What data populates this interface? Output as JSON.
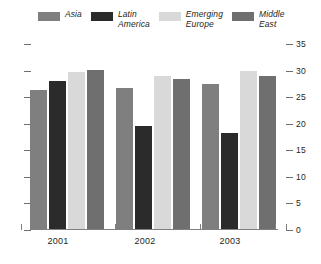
{
  "chart_data": {
    "type": "bar",
    "title": "",
    "subtitle": "",
    "xlabel": "",
    "ylabel": "",
    "categories": [
      "2001",
      "2002",
      "2003"
    ],
    "series": [
      {
        "name": "Asia",
        "color": "#7f7f7f",
        "values": [
          26.3,
          26.8,
          27.4
        ]
      },
      {
        "name": "Latin\nAmerica",
        "color": "#2b2b2b",
        "values": [
          28.0,
          19.5,
          18.3
        ]
      },
      {
        "name": "Emerging\nEurope",
        "color": "#d9d9d9",
        "values": [
          29.7,
          28.9,
          29.9
        ]
      },
      {
        "name": "Middle\nEast",
        "color": "#6f6f6f",
        "values": [
          30.2,
          28.5,
          28.9
        ]
      }
    ],
    "ylim": [
      0,
      35
    ],
    "ytick_values": [
      0,
      5,
      10,
      15,
      20,
      25,
      30,
      35
    ],
    "ytick_labels_right": [
      "0",
      "5",
      "10",
      "15",
      "20",
      "25",
      "30",
      "35"
    ],
    "ytick_labels_left": [
      "",
      "",
      "",
      "",
      "",
      "",
      "",
      ""
    ],
    "grid": false,
    "legend_position": "top",
    "axis_label_side": "right"
  },
  "legend": {
    "items": [
      {
        "label": "Asia",
        "color": "#7f7f7f"
      },
      {
        "label": "Latin\nAmerica",
        "color": "#2b2b2b"
      },
      {
        "label": "Emerging\nEurope",
        "color": "#d9d9d9"
      },
      {
        "label": "Middle\nEast",
        "color": "#6f6f6f"
      }
    ]
  },
  "axis": {
    "right_labels": [
      "35",
      "30",
      "25",
      "20",
      "15",
      "10",
      "5",
      "0"
    ]
  },
  "xaxis": {
    "labels": [
      "2001",
      "2002",
      "2003"
    ]
  },
  "colors": {
    "background": "#ffffff",
    "axis": "#808080",
    "text": "#231f20"
  }
}
